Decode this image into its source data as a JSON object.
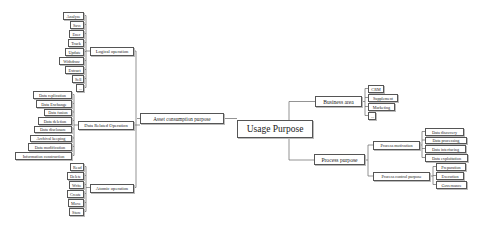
{
  "diagram": {
    "type": "mind-map",
    "root": {
      "label": "Usage Purpose"
    },
    "left": {
      "label": "Asset consumption purpose",
      "groups": [
        {
          "label": "Logical operation",
          "items": [
            "Analyze",
            "Save",
            "Ener",
            "Track",
            "Update",
            "Withdraw",
            "Extract",
            "Sell",
            "..."
          ]
        },
        {
          "label": "Data Related Operation",
          "items": [
            "Data replication",
            "Data Exchange",
            "Data fusion",
            "Data deletion",
            "Data disclosure",
            "Archival keeping",
            "Data modification",
            "Information construction"
          ]
        },
        {
          "label": "Atomic operation",
          "items": [
            "Read",
            "Delete",
            "Write",
            "Create",
            "Move",
            "Store"
          ]
        }
      ]
    },
    "right": {
      "business": {
        "label": "Business area",
        "items": [
          "CRM",
          "Supplement",
          "Marketing",
          "..."
        ]
      },
      "process": {
        "label": "Process purpose",
        "motivation": {
          "label": "Process motivation",
          "items": [
            "Data discovery",
            "Data processing",
            "Data interfacing",
            "Data exploitation"
          ]
        },
        "control": {
          "label": "Process control purpose",
          "items": [
            "Preparation",
            "Execution",
            "Governance"
          ]
        }
      }
    }
  },
  "colors": {
    "line": "#666666",
    "border": "#555555",
    "background": "#ffffff"
  }
}
